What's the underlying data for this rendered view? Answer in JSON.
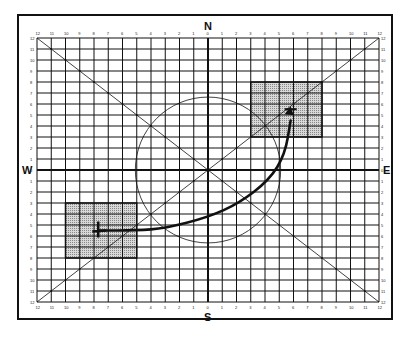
{
  "diagram": {
    "title": "",
    "compass": {
      "north": "N",
      "south": "S",
      "east": "E",
      "west": "W"
    },
    "grid": {
      "units_per_half_axis": 12,
      "x_tick_labels_top": [
        "12",
        "11",
        "10",
        "9",
        "8",
        "7",
        "6",
        "5",
        "4",
        "3",
        "2",
        "1",
        "0",
        "1",
        "2",
        "3",
        "4",
        "5",
        "6",
        "7",
        "8",
        "9",
        "10",
        "11",
        "12"
      ],
      "x_tick_labels_bottom": [
        "12",
        "11",
        "10",
        "9",
        "8",
        "7",
        "6",
        "5",
        "4",
        "3",
        "2",
        "1",
        "0",
        "1",
        "2",
        "3",
        "4",
        "5",
        "6",
        "7",
        "8",
        "9",
        "10",
        "11",
        "12"
      ],
      "y_tick_labels_left": [
        "12",
        "11",
        "10",
        "9",
        "8",
        "7",
        "6",
        "5",
        "4",
        "3",
        "2",
        "1",
        "0",
        "1",
        "2",
        "3",
        "4",
        "5",
        "6",
        "7",
        "8",
        "9",
        "10",
        "11",
        "12"
      ],
      "y_tick_labels_right": [
        "12",
        "11",
        "10",
        "9",
        "8",
        "7",
        "6",
        "5",
        "4",
        "3",
        "2",
        "1",
        "0",
        "1",
        "2",
        "3",
        "4",
        "5",
        "6",
        "7",
        "8",
        "9",
        "10",
        "11",
        "12"
      ]
    },
    "circle": {
      "center": [
        0,
        0
      ],
      "radius_units": 5.1
    },
    "diagonals": [
      {
        "name": "sw-ne",
        "from": [
          -12,
          -12
        ],
        "to": [
          12,
          12
        ]
      },
      {
        "name": "nw-se",
        "from": [
          -12,
          12
        ],
        "to": [
          12,
          -12
        ]
      }
    ],
    "shaded_regions": [
      {
        "name": "target-zone-ne",
        "x": [
          3,
          8
        ],
        "y": [
          3,
          8
        ]
      },
      {
        "name": "origin-zone-sw",
        "x": [
          -10,
          -5
        ],
        "y": [
          -8,
          -3
        ]
      }
    ],
    "path": {
      "name": "trajectory",
      "points": [
        [
          -7.7,
          -5.5
        ],
        [
          -5,
          -5.5
        ],
        [
          -3,
          -5.3
        ],
        [
          0,
          -4.3
        ],
        [
          2.2,
          -3.0
        ],
        [
          4.3,
          -0.9
        ],
        [
          5.4,
          1.4
        ],
        [
          5.8,
          4.5
        ]
      ],
      "start_marker": [
        -7.7,
        -5.5
      ],
      "end_marker": [
        5.8,
        5.8
      ]
    },
    "colors": {
      "line": "#111111",
      "shade": "#bdbdbd",
      "background": "#ffffff"
    }
  }
}
